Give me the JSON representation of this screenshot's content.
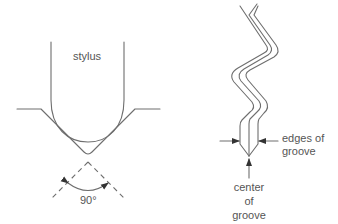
{
  "diagram": {
    "left_panel": {
      "stylus_label": "stylus",
      "angle_label": "90°"
    },
    "right_panel": {
      "edges_label_line1": "edges of",
      "edges_label_line2": "groove",
      "center_label_line1": "center",
      "center_label_line2": "of",
      "center_label_line3": "groove"
    },
    "colors": {
      "stroke": "#6e6e6e",
      "text": "#555555",
      "background": "#ffffff"
    }
  }
}
